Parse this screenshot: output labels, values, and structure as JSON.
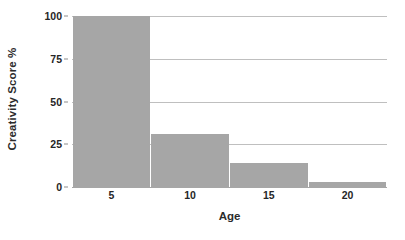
{
  "chart_data": {
    "type": "bar",
    "title": "",
    "xlabel": "Age",
    "ylabel": "Creativity Score %",
    "categories": [
      "5",
      "10",
      "15",
      "20"
    ],
    "values": [
      100,
      31,
      14,
      3
    ],
    "series": [
      {
        "name": "Creativity Score %",
        "values": [
          100,
          31,
          14,
          3
        ]
      }
    ],
    "ylim": [
      0,
      100
    ],
    "yticks": [
      0,
      25,
      50,
      75,
      100
    ],
    "ytick_labels": [
      "0",
      "25",
      "50",
      "75",
      "100"
    ],
    "xtick_labels": [
      "5",
      "10",
      "15",
      "20"
    ],
    "grid": "horizontal",
    "legend": "none",
    "bar_color": "#a6a6a6",
    "gridline_color": "#bfbfbf",
    "background_color": "#ffffff",
    "text_color": "#262626"
  }
}
